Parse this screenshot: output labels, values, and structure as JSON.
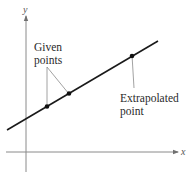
{
  "diagram": {
    "axes": {
      "x_label": "x",
      "y_label": "y"
    },
    "annotations": {
      "given_points_line1": "Given",
      "given_points_line2": "points",
      "extrapolated_line1": "Extrapolated",
      "extrapolated_line2": "point"
    },
    "points": [
      {
        "role": "given",
        "label": "Given point 1"
      },
      {
        "role": "given",
        "label": "Given point 2"
      },
      {
        "role": "extrapolated",
        "label": "Extrapolated point"
      }
    ],
    "colors": {
      "line": "#1a1a1a",
      "axis": "#8a8a8a",
      "leader": "#8a8a8a",
      "point": "#111111"
    }
  }
}
